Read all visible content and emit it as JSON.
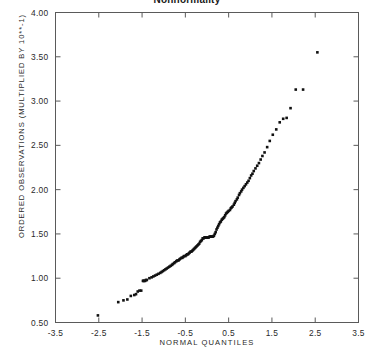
{
  "chart_data": {
    "type": "scatter",
    "title": "Nonnormality",
    "xlabel": "NORMAL  QUANTILES",
    "ylabel": "ORDERED OBSERVATIONS (MULTIPLIED BY 10**-1)",
    "xlim": [
      -3.5,
      3.5
    ],
    "ylim": [
      0.5,
      4.0
    ],
    "xticks": [
      -3.5,
      -2.5,
      -1.5,
      -0.5,
      0.5,
      1.5,
      2.5,
      3.5
    ],
    "xtick_labels": [
      "-3.5",
      "-2.5",
      "-1.5",
      "-0.5",
      "0.5",
      "1.5",
      "2.5",
      "3.5"
    ],
    "yticks": [
      0.5,
      1.0,
      1.5,
      2.0,
      2.5,
      3.0,
      3.5,
      4.0
    ],
    "ytick_labels": [
      "0.50",
      "1.00",
      "1.50",
      "2.00",
      "2.50",
      "3.00",
      "3.50",
      "4.00"
    ],
    "grid": false,
    "legend": null,
    "marker": "filled-square",
    "marker_color": "#111111",
    "marker_size_px": 2.6,
    "series": [
      {
        "name": "ordered observations",
        "x": [
          -2.52,
          -2.05,
          -1.93,
          -1.84,
          -1.76,
          -1.68,
          -1.64,
          -1.6,
          -1.56,
          -1.52,
          -1.48,
          -1.47,
          -1.45,
          -1.43,
          -1.41,
          -1.39,
          -1.33,
          -1.28,
          -1.24,
          -1.2,
          -1.16,
          -1.12,
          -1.08,
          -1.05,
          -1.02,
          -0.99,
          -0.96,
          -0.93,
          -0.9,
          -0.87,
          -0.84,
          -0.81,
          -0.79,
          -0.76,
          -0.74,
          -0.71,
          -0.69,
          -0.66,
          -0.64,
          -0.62,
          -0.59,
          -0.57,
          -0.55,
          -0.53,
          -0.5,
          -0.48,
          -0.46,
          -0.44,
          -0.42,
          -0.4,
          -0.38,
          -0.36,
          -0.34,
          -0.32,
          -0.3,
          -0.28,
          -0.26,
          -0.24,
          -0.22,
          -0.2,
          -0.18,
          -0.16,
          -0.14,
          -0.12,
          -0.1,
          -0.08,
          -0.06,
          -0.04,
          -0.02,
          0.0,
          0.02,
          0.04,
          0.06,
          0.08,
          0.1,
          0.12,
          0.14,
          0.16,
          0.18,
          0.2,
          0.22,
          0.24,
          0.26,
          0.28,
          0.3,
          0.32,
          0.34,
          0.36,
          0.38,
          0.4,
          0.42,
          0.44,
          0.46,
          0.48,
          0.5,
          0.53,
          0.55,
          0.57,
          0.59,
          0.62,
          0.64,
          0.66,
          0.69,
          0.71,
          0.74,
          0.76,
          0.79,
          0.81,
          0.84,
          0.87,
          0.9,
          0.93,
          0.96,
          0.99,
          1.02,
          1.05,
          1.08,
          1.12,
          1.16,
          1.2,
          1.24,
          1.28,
          1.33,
          1.39,
          1.45,
          1.52,
          1.6,
          1.68,
          1.76,
          1.84,
          1.93,
          2.05,
          2.22,
          2.55
        ],
        "y": [
          0.58,
          0.73,
          0.75,
          0.76,
          0.8,
          0.81,
          0.82,
          0.85,
          0.86,
          0.86,
          0.97,
          0.97,
          0.97,
          0.97,
          0.98,
          0.98,
          1.0,
          1.01,
          1.02,
          1.03,
          1.04,
          1.05,
          1.06,
          1.07,
          1.08,
          1.09,
          1.1,
          1.11,
          1.12,
          1.13,
          1.14,
          1.15,
          1.16,
          1.17,
          1.18,
          1.19,
          1.2,
          1.2,
          1.21,
          1.22,
          1.23,
          1.23,
          1.24,
          1.25,
          1.25,
          1.26,
          1.27,
          1.27,
          1.28,
          1.29,
          1.3,
          1.3,
          1.31,
          1.32,
          1.33,
          1.34,
          1.35,
          1.36,
          1.37,
          1.38,
          1.39,
          1.41,
          1.42,
          1.43,
          1.45,
          1.45,
          1.46,
          1.46,
          1.46,
          1.46,
          1.46,
          1.46,
          1.47,
          1.47,
          1.47,
          1.47,
          1.47,
          1.48,
          1.5,
          1.52,
          1.55,
          1.57,
          1.59,
          1.61,
          1.63,
          1.64,
          1.66,
          1.67,
          1.68,
          1.69,
          1.71,
          1.73,
          1.74,
          1.75,
          1.76,
          1.77,
          1.79,
          1.8,
          1.81,
          1.83,
          1.85,
          1.87,
          1.89,
          1.91,
          1.94,
          1.96,
          1.98,
          2.0,
          2.02,
          2.04,
          2.06,
          2.08,
          2.1,
          2.13,
          2.16,
          2.18,
          2.21,
          2.24,
          2.27,
          2.3,
          2.34,
          2.38,
          2.42,
          2.48,
          2.55,
          2.62,
          2.68,
          2.76,
          2.8,
          2.81,
          2.92,
          3.13,
          3.13,
          3.55
        ]
      }
    ]
  }
}
